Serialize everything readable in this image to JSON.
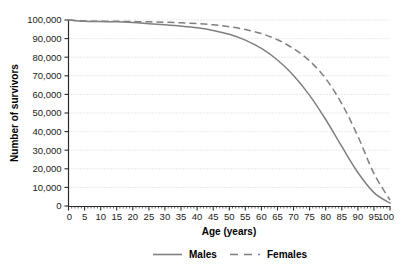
{
  "chart_data": {
    "type": "line",
    "title": "",
    "xlabel": "Age (years)",
    "ylabel": "Number of survivors",
    "xlim": [
      0,
      100
    ],
    "ylim": [
      0,
      100000
    ],
    "grid": true,
    "grid_axis": "y",
    "legend_position": "bottom",
    "xticks": [
      0,
      5,
      10,
      15,
      20,
      25,
      30,
      35,
      40,
      45,
      50,
      55,
      60,
      65,
      70,
      75,
      80,
      85,
      90,
      95,
      100
    ],
    "xtick_labels": [
      "0",
      "5",
      "10",
      "15",
      "20",
      "25",
      "30",
      "35",
      "40",
      "45",
      "50",
      "55",
      "60",
      "65",
      "70",
      "75",
      "80",
      "85",
      "90",
      "95",
      "100"
    ],
    "yticks": [
      0,
      10000,
      20000,
      30000,
      40000,
      50000,
      60000,
      70000,
      80000,
      90000,
      100000
    ],
    "ytick_labels": [
      "0",
      "10,000",
      "20,000",
      "30,000",
      "40,000",
      "50,000",
      "60,000",
      "70,000",
      "80,000",
      "90,000",
      "100,000"
    ],
    "x": [
      0,
      5,
      10,
      15,
      20,
      25,
      30,
      35,
      40,
      45,
      50,
      55,
      60,
      65,
      70,
      75,
      80,
      85,
      90,
      95,
      100
    ],
    "series": [
      {
        "name": "Males",
        "style": "solid",
        "color": "#7f7f7f",
        "values": [
          100000,
          99300,
          99150,
          99000,
          98600,
          98000,
          97400,
          96700,
          95800,
          94400,
          92300,
          89200,
          84700,
          78500,
          70200,
          59500,
          46500,
          32000,
          18000,
          7200,
          1500
        ]
      },
      {
        "name": "Females",
        "style": "dashed",
        "color": "#7f7f7f",
        "values": [
          100000,
          99450,
          99350,
          99280,
          99150,
          99000,
          98800,
          98500,
          98050,
          97400,
          96400,
          94900,
          92700,
          89400,
          84600,
          78000,
          68500,
          55000,
          37500,
          17500,
          3200
        ]
      }
    ]
  },
  "legend": {
    "items": [
      {
        "label": "Males",
        "style": "solid"
      },
      {
        "label": "Females",
        "style": "dashed"
      }
    ]
  },
  "colors": {
    "line": "#7f7f7f",
    "axis": "#2b2b2b",
    "grid": "#c8c8c8",
    "text": "#000000",
    "background": "#ffffff"
  }
}
